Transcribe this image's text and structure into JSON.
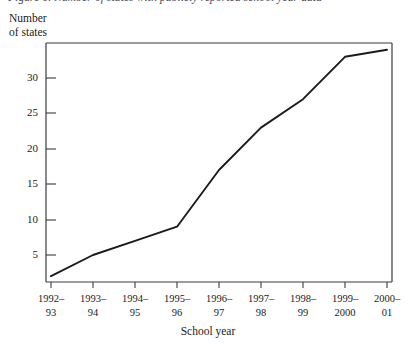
{
  "figure": {
    "caption_sliver": "Figure 1. Number of states with publicly reported school year data",
    "y_axis_title": "Number\nof states",
    "x_axis_title": "School year"
  },
  "chart_data": {
    "type": "line",
    "title": "",
    "xlabel": "School year",
    "ylabel": "Number of states",
    "categories": [
      "1992–93",
      "1993–94",
      "1994–95",
      "1995–96",
      "1996–97",
      "1997–98",
      "1998–99",
      "1999–2000",
      "2000–01"
    ],
    "category_lines": [
      [
        "1992–",
        "93"
      ],
      [
        "1993–",
        "94"
      ],
      [
        "1994–",
        "95"
      ],
      [
        "1995–",
        "96"
      ],
      [
        "1996–",
        "97"
      ],
      [
        "1997–",
        "98"
      ],
      [
        "1998–",
        "99"
      ],
      [
        "1999–",
        "2000"
      ],
      [
        "2000–",
        "01"
      ]
    ],
    "values": [
      2,
      5,
      7,
      9,
      17,
      23,
      27,
      33,
      34
    ],
    "ytick_labels": [
      "5",
      "10",
      "15",
      "20",
      "25",
      "30"
    ],
    "yticks": [
      5,
      10,
      15,
      20,
      25,
      30
    ],
    "ylim": [
      0,
      35
    ],
    "grid": false,
    "legend": false,
    "line_color": "#1a1a1f",
    "axis_color": "#3a3a42"
  }
}
